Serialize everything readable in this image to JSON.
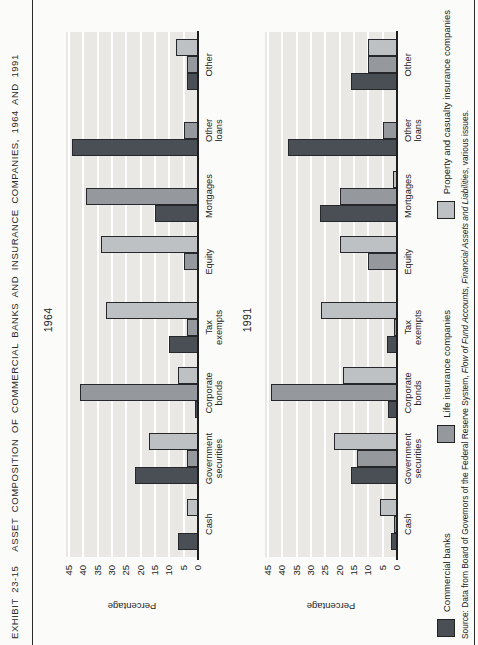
{
  "header": {
    "exhibit_label": "EXHIBIT 23-15",
    "title": "ASSET COMPOSITION OF COMMERCIAL BANKS AND INSURANCE COMPANIES, 1964 AND 1991"
  },
  "colors": {
    "commercial_banks": "#4a4f55",
    "life_insurance": "#95989c",
    "property_casualty": "#bec1c3",
    "plot_background": "#e9e8e5",
    "gridline": "#ffffff"
  },
  "legend": {
    "items": [
      {
        "label": "Commercial banks",
        "color": "#4a4f55"
      },
      {
        "label": "Life insurance companies",
        "color": "#95989c"
      },
      {
        "label": "Property and casualty insurance companies",
        "color": "#bec1c3"
      }
    ]
  },
  "source": {
    "prefix": "Source: Data from Board of Governors of the Federal Reserve System, ",
    "italic_part": "Flow of Fund Accounts, Financial Assets and Liabilities",
    "suffix": ", various issues."
  },
  "axis": {
    "ylabel": "Percentage",
    "ymin": 0,
    "ymax": 45,
    "tick_step": 5,
    "grid": true
  },
  "chart_data": [
    {
      "type": "bar",
      "title": "1964",
      "xlabel": "",
      "ylabel": "Percentage",
      "ylim": [
        0,
        45
      ],
      "categories": [
        "Cash",
        "Government securities",
        "Corporate bonds",
        "Tax exempts",
        "Equity",
        "Mortgages",
        "Other loans",
        "Other"
      ],
      "series": [
        {
          "name": "Commercial banks",
          "color": "#4a4f55",
          "values": [
            7,
            22,
            1,
            10,
            0,
            15,
            44,
            4
          ]
        },
        {
          "name": "Life insurance companies",
          "color": "#95989c",
          "values": [
            0,
            4,
            41,
            4,
            5,
            39,
            5,
            4
          ]
        },
        {
          "name": "Property and casualty insurance companies",
          "color": "#bec1c3",
          "values": [
            4,
            17,
            7,
            32,
            34,
            0,
            0,
            7.5
          ]
        }
      ]
    },
    {
      "type": "bar",
      "title": "1991",
      "xlabel": "",
      "ylabel": "Percentage",
      "ylim": [
        0,
        45
      ],
      "categories": [
        "Cash",
        "Government securities",
        "Corporate bonds",
        "Tax exempts",
        "Equity",
        "Mortgages",
        "Other loans",
        "Other"
      ],
      "series": [
        {
          "name": "Commercial banks",
          "color": "#4a4f55",
          "values": [
            2,
            16,
            3,
            3.5,
            0,
            27,
            38,
            16
          ]
        },
        {
          "name": "Life insurance companies",
          "color": "#95989c",
          "values": [
            1,
            14,
            44,
            1,
            10,
            20,
            5,
            10
          ]
        },
        {
          "name": "Property and casualty insurance companies",
          "color": "#bec1c3",
          "values": [
            6,
            22,
            19,
            26.5,
            20,
            1.5,
            0,
            10
          ]
        }
      ]
    }
  ]
}
